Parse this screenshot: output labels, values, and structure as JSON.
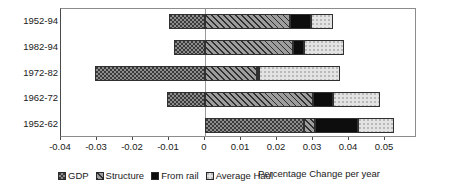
{
  "chart_data": {
    "type": "bar",
    "orientation": "horizontal",
    "stacked": true,
    "title": "",
    "xlabel": "Percentage Change per year",
    "ylabel": "",
    "xlim": [
      -0.04,
      0.0589
    ],
    "grid": false,
    "zero_reference_line": true,
    "legend_position": "bottom-left",
    "categories": [
      "1952-94",
      "1982-94",
      "1972-82",
      "1962-72",
      "1952-62"
    ],
    "xticks": [
      -0.04,
      -0.03,
      -0.02,
      -0.01,
      0,
      0.01,
      0.02,
      0.03,
      0.04,
      0.05
    ],
    "xticklabels": [
      "-0.04",
      "-0.03",
      "-0.02",
      "-0.01",
      "0",
      "0.01",
      "0.02",
      "0.03",
      "0.04",
      "0.05"
    ],
    "series": [
      {
        "name": "GDP",
        "pattern": "dotted-dark",
        "values": [
          -0.01,
          -0.0085,
          -0.0305,
          -0.0105,
          0.0275
        ]
      },
      {
        "name": "Structure",
        "pattern": "diagonal-hatch",
        "values": [
          0.0235,
          0.0245,
          0.0145,
          0.03,
          0.003
        ]
      },
      {
        "name": "From rail",
        "pattern": "solid-black",
        "values": [
          0.006,
          0.003,
          0.0005,
          0.0055,
          0.012
        ]
      },
      {
        "name": "Average Haul",
        "pattern": "light-stipple",
        "values": [
          0.006,
          0.011,
          0.0225,
          0.013,
          0.01
        ]
      }
    ],
    "bar_segments": [
      {
        "category": "1952-94",
        "segments": [
          {
            "series": "GDP",
            "start": -0.01,
            "end": 0.0
          },
          {
            "series": "Structure",
            "start": 0.0,
            "end": 0.0235
          },
          {
            "series": "From rail",
            "start": 0.0235,
            "end": 0.0295
          },
          {
            "series": "Average Haul",
            "start": 0.0295,
            "end": 0.0355
          }
        ]
      },
      {
        "category": "1982-94",
        "segments": [
          {
            "series": "GDP",
            "start": -0.0085,
            "end": 0.0
          },
          {
            "series": "Structure",
            "start": 0.0,
            "end": 0.0245
          },
          {
            "series": "From rail",
            "start": 0.0245,
            "end": 0.0275
          },
          {
            "series": "Average Haul",
            "start": 0.0275,
            "end": 0.0385
          }
        ]
      },
      {
        "category": "1972-82",
        "segments": [
          {
            "series": "GDP",
            "start": -0.0305,
            "end": 0.0
          },
          {
            "series": "Structure",
            "start": 0.0,
            "end": 0.0145
          },
          {
            "series": "From rail",
            "start": 0.0145,
            "end": 0.015
          },
          {
            "series": "Average Haul",
            "start": 0.015,
            "end": 0.0375
          }
        ]
      },
      {
        "category": "1962-72",
        "segments": [
          {
            "series": "GDP",
            "start": -0.0105,
            "end": 0.0
          },
          {
            "series": "Structure",
            "start": 0.0,
            "end": 0.03
          },
          {
            "series": "From rail",
            "start": 0.03,
            "end": 0.0355
          },
          {
            "series": "Average Haul",
            "start": 0.0355,
            "end": 0.0485
          }
        ]
      },
      {
        "category": "1952-62",
        "segments": [
          {
            "series": "GDP",
            "start": 0.0,
            "end": 0.0275
          },
          {
            "series": "Structure",
            "start": 0.0275,
            "end": 0.0305
          },
          {
            "series": "From rail",
            "start": 0.0305,
            "end": 0.0425
          },
          {
            "series": "Average Haul",
            "start": 0.0425,
            "end": 0.0525
          }
        ]
      }
    ]
  },
  "legend": {
    "items": [
      {
        "label": "GDP",
        "swatch": "gdp-swatch"
      },
      {
        "label": "Structure",
        "swatch": "structure-swatch"
      },
      {
        "label": "From rail",
        "swatch": "from-rail-swatch"
      },
      {
        "label": "Average Haul",
        "swatch": "average-haul-swatch"
      }
    ]
  },
  "axis_title": "Percentage Change per year",
  "colors": {
    "gdp": "#8d8d8d",
    "structure": "#777777",
    "from_rail": "#0d0d0d",
    "average_haul": "#e3e3e3",
    "frame": "#8c8c8c",
    "text": "#1a1a1a"
  }
}
